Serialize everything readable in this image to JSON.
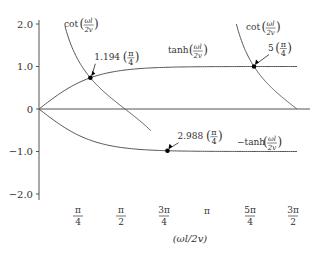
{
  "chart_data": {
    "type": "line",
    "title": "",
    "xlabel": "(ωl/2v)",
    "ylabel": "",
    "xlim_over_pi4": [
      0,
      6.3
    ],
    "ylim": [
      -2.1,
      2.1
    ],
    "grid": false,
    "legend": "none",
    "yticks": [
      {
        "value": 2.0,
        "label": "2.0"
      },
      {
        "value": 1.0,
        "label": "1.0"
      },
      {
        "value": 0,
        "label": "0"
      },
      {
        "value": -1.0,
        "label": "−1.0"
      },
      {
        "value": -2.0,
        "label": "−2.0"
      }
    ],
    "xticks": [
      {
        "value_over_pi4": 1,
        "num": "π",
        "den": "4"
      },
      {
        "value_over_pi4": 2,
        "num": "π",
        "den": "2"
      },
      {
        "value_over_pi4": 3,
        "num": "3π",
        "den": "4"
      },
      {
        "value_over_pi4": 4,
        "num": "π",
        "den": ""
      },
      {
        "value_over_pi4": 5,
        "num": "5π",
        "den": "4"
      },
      {
        "value_over_pi4": 6,
        "num": "3π",
        "den": "2"
      }
    ],
    "series": [
      {
        "name": "tanh(ωl/2v)",
        "function": "tanh",
        "x_range_over_pi4": [
          0,
          6
        ]
      },
      {
        "name": "−tanh(ωl/2v)",
        "function": "neg_tanh",
        "x_range_over_pi4": [
          0,
          6
        ]
      },
      {
        "name": "cot(ωl/2v) branch 1",
        "function": "cot",
        "x_range_over_pi4": [
          0.604,
          2.6
        ]
      },
      {
        "name": "cot(ωl/2v) branch 2",
        "function": "cot",
        "x_range_over_pi4": [
          4.59,
          6
        ]
      }
    ],
    "intersections": [
      {
        "x_over_pi4": 1.194,
        "label": "1.194",
        "curve": "tanh"
      },
      {
        "x_over_pi4": 2.988,
        "label": "2.988",
        "curve": "neg_tanh"
      },
      {
        "x_over_pi4": 5,
        "label": "5",
        "curve": "tanh"
      }
    ],
    "curve_labels": [
      {
        "prefix": "cot",
        "num": "ωl",
        "den": "2v",
        "near": "cot branch 1 top"
      },
      {
        "prefix": "tanh",
        "num": "ωl",
        "den": "2v",
        "near": "tanh curve middle"
      },
      {
        "prefix": "cot",
        "num": "ωl",
        "den": "2v",
        "near": "cot branch 2 top"
      },
      {
        "prefix": "−tanh",
        "num": "ωl",
        "den": "2v",
        "near": "−tanh curve right"
      }
    ],
    "fraction_pi4": {
      "num": "π",
      "den": "4"
    }
  }
}
